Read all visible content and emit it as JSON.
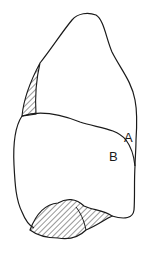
{
  "diagram": {
    "type": "line-drawing",
    "labels": [
      {
        "id": "A",
        "text": "A"
      },
      {
        "id": "B",
        "text": "B"
      }
    ],
    "colors": {
      "stroke": "#1a1a1a",
      "background": "#ffffff",
      "hatch": "#1a1a1a"
    }
  }
}
